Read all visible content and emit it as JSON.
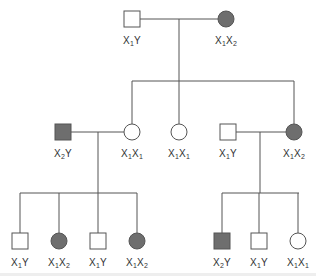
{
  "colors": {
    "line": "#555555",
    "affected_fill": "#6e6e6e",
    "unaffected_fill": "#ffffff",
    "text": "#333333"
  },
  "individuals": [
    {
      "id": "g1-father",
      "sex": "male",
      "affected": false,
      "x": 132,
      "y": 19,
      "genotype": {
        "a": "X",
        "a_sub": "1",
        "b": "Y",
        "b_sub": ""
      }
    },
    {
      "id": "g1-mother",
      "sex": "female",
      "affected": true,
      "x": 226,
      "y": 19,
      "genotype": {
        "a": "X",
        "a_sub": "1",
        "b": "X",
        "b_sub": "2"
      }
    },
    {
      "id": "g2-husband-left",
      "sex": "male",
      "affected": true,
      "x": 63,
      "y": 132,
      "genotype": {
        "a": "X",
        "a_sub": "2",
        "b": "Y",
        "b_sub": ""
      }
    },
    {
      "id": "g2-daughter-1",
      "sex": "female",
      "affected": false,
      "x": 132,
      "y": 132,
      "genotype": {
        "a": "X",
        "a_sub": "1",
        "b": "X",
        "b_sub": "1"
      }
    },
    {
      "id": "g2-daughter-2",
      "sex": "female",
      "affected": false,
      "x": 179,
      "y": 132,
      "genotype": {
        "a": "X",
        "a_sub": "1",
        "b": "X",
        "b_sub": "1"
      }
    },
    {
      "id": "g2-husband-right",
      "sex": "male",
      "affected": false,
      "x": 228,
      "y": 132,
      "genotype": {
        "a": "X",
        "a_sub": "1",
        "b": "Y",
        "b_sub": ""
      }
    },
    {
      "id": "g2-daughter-3",
      "sex": "female",
      "affected": true,
      "x": 294,
      "y": 132,
      "genotype": {
        "a": "X",
        "a_sub": "1",
        "b": "X",
        "b_sub": "2"
      }
    },
    {
      "id": "g3-left-1",
      "sex": "male",
      "affected": false,
      "x": 20,
      "y": 241,
      "genotype": {
        "a": "X",
        "a_sub": "1",
        "b": "Y",
        "b_sub": ""
      }
    },
    {
      "id": "g3-left-2",
      "sex": "female",
      "affected": true,
      "x": 59,
      "y": 241,
      "genotype": {
        "a": "X",
        "a_sub": "1",
        "b": "X",
        "b_sub": "2"
      }
    },
    {
      "id": "g3-left-3",
      "sex": "male",
      "affected": false,
      "x": 98,
      "y": 241,
      "genotype": {
        "a": "X",
        "a_sub": "1",
        "b": "Y",
        "b_sub": ""
      }
    },
    {
      "id": "g3-left-4",
      "sex": "female",
      "affected": true,
      "x": 137,
      "y": 241,
      "genotype": {
        "a": "X",
        "a_sub": "1",
        "b": "X",
        "b_sub": "2"
      }
    },
    {
      "id": "g3-right-1",
      "sex": "male",
      "affected": true,
      "x": 222,
      "y": 241,
      "genotype": {
        "a": "X",
        "a_sub": "2",
        "b": "Y",
        "b_sub": ""
      }
    },
    {
      "id": "g3-right-2",
      "sex": "male",
      "affected": false,
      "x": 259,
      "y": 241,
      "genotype": {
        "a": "X",
        "a_sub": "1",
        "b": "Y",
        "b_sub": ""
      }
    },
    {
      "id": "g3-right-3",
      "sex": "female",
      "affected": false,
      "x": 298,
      "y": 241,
      "genotype": {
        "a": "X",
        "a_sub": "1",
        "b": "X",
        "b_sub": "1"
      }
    }
  ],
  "lines": [
    {
      "name": "g1-marriage-line",
      "x1": 140,
      "y1": 19,
      "x2": 218,
      "y2": 19
    },
    {
      "name": "g1-descent-line",
      "x1": 179,
      "y1": 19,
      "x2": 179,
      "y2": 81
    },
    {
      "name": "g2-sibship-line",
      "x1": 132,
      "y1": 81,
      "x2": 294,
      "y2": 81
    },
    {
      "name": "g2-drop-1",
      "x1": 132,
      "y1": 81,
      "x2": 132,
      "y2": 124
    },
    {
      "name": "g2-drop-2",
      "x1": 179,
      "y1": 81,
      "x2": 179,
      "y2": 124
    },
    {
      "name": "g2-drop-3",
      "x1": 294,
      "y1": 81,
      "x2": 294,
      "y2": 124
    },
    {
      "name": "g2-left-marriage-line",
      "x1": 71,
      "y1": 132,
      "x2": 124,
      "y2": 132
    },
    {
      "name": "g2-left-descent-line",
      "x1": 98,
      "y1": 132,
      "x2": 98,
      "y2": 193
    },
    {
      "name": "g2-right-marriage-line",
      "x1": 236,
      "y1": 132,
      "x2": 286,
      "y2": 132
    },
    {
      "name": "g2-right-descent-line",
      "x1": 260,
      "y1": 132,
      "x2": 260,
      "y2": 193
    },
    {
      "name": "g3-left-sibship-line",
      "x1": 20,
      "y1": 193,
      "x2": 137,
      "y2": 193
    },
    {
      "name": "g3-left-drop-1",
      "x1": 20,
      "y1": 193,
      "x2": 20,
      "y2": 233
    },
    {
      "name": "g3-left-drop-2",
      "x1": 59,
      "y1": 193,
      "x2": 59,
      "y2": 233
    },
    {
      "name": "g3-left-drop-3",
      "x1": 98,
      "y1": 193,
      "x2": 98,
      "y2": 233
    },
    {
      "name": "g3-left-drop-4",
      "x1": 137,
      "y1": 193,
      "x2": 137,
      "y2": 233
    },
    {
      "name": "g3-right-sibship-line",
      "x1": 222,
      "y1": 193,
      "x2": 299,
      "y2": 193
    },
    {
      "name": "g3-right-drop-1",
      "x1": 222,
      "y1": 193,
      "x2": 222,
      "y2": 233
    },
    {
      "name": "g3-right-drop-2",
      "x1": 259,
      "y1": 193,
      "x2": 259,
      "y2": 233
    },
    {
      "name": "g3-right-drop-3",
      "x1": 298,
      "y1": 193,
      "x2": 298,
      "y2": 233
    }
  ]
}
